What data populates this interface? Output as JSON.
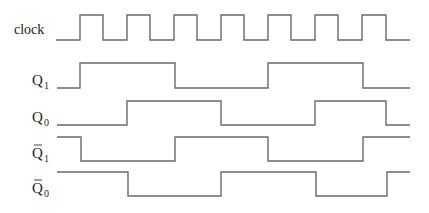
{
  "diagram": {
    "type": "timing-diagram",
    "signals": [
      {
        "name": "clock",
        "label": "clock",
        "subscript": "",
        "overbar": false,
        "y_high": 15,
        "y_low": 40,
        "label_x": 14,
        "label_y": 34,
        "points": [
          [
            56,
            "L"
          ],
          [
            80,
            "H"
          ],
          [
            103,
            "L"
          ],
          [
            127,
            "H"
          ],
          [
            150,
            "L"
          ],
          [
            174,
            "H"
          ],
          [
            197,
            "L"
          ],
          [
            221,
            "H"
          ],
          [
            244,
            "L"
          ],
          [
            268,
            "H"
          ],
          [
            291,
            "L"
          ],
          [
            315,
            "H"
          ],
          [
            338,
            "L"
          ],
          [
            362,
            "H"
          ],
          [
            386,
            "L"
          ],
          [
            410,
            "L"
          ]
        ]
      },
      {
        "name": "q1",
        "label": "Q",
        "subscript": "1",
        "overbar": false,
        "y_high": 63,
        "y_low": 88,
        "label_x": 32,
        "label_y": 85,
        "points": [
          [
            57,
            "L"
          ],
          [
            80,
            "H"
          ],
          [
            175,
            "L"
          ],
          [
            268,
            "H"
          ],
          [
            363,
            "L"
          ],
          [
            410,
            "L"
          ]
        ]
      },
      {
        "name": "q0",
        "label": "Q",
        "subscript": "0",
        "overbar": false,
        "y_high": 101,
        "y_low": 125,
        "label_x": 32,
        "label_y": 122,
        "points": [
          [
            57,
            "L"
          ],
          [
            127,
            "H"
          ],
          [
            221,
            "L"
          ],
          [
            315,
            "H"
          ],
          [
            386,
            "L"
          ],
          [
            410,
            "L"
          ]
        ]
      },
      {
        "name": "q1-bar",
        "label": "Q",
        "subscript": "1",
        "overbar": true,
        "y_high": 137,
        "y_low": 161,
        "label_x": 32,
        "label_y": 158,
        "points": [
          [
            57,
            "H"
          ],
          [
            81,
            "L"
          ],
          [
            175,
            "H"
          ],
          [
            268,
            "L"
          ],
          [
            363,
            "H"
          ],
          [
            410,
            "H"
          ]
        ]
      },
      {
        "name": "q0-bar",
        "label": "Q",
        "subscript": "0",
        "overbar": true,
        "y_high": 172,
        "y_low": 196,
        "label_x": 32,
        "label_y": 193,
        "points": [
          [
            57,
            "H"
          ],
          [
            128,
            "L"
          ],
          [
            221,
            "H"
          ],
          [
            316,
            "L"
          ],
          [
            387,
            "H"
          ],
          [
            410,
            "H"
          ]
        ]
      }
    ],
    "colors": {
      "waveform": "#6a6a6a",
      "label": "#222222",
      "background": "#ffffff"
    }
  }
}
